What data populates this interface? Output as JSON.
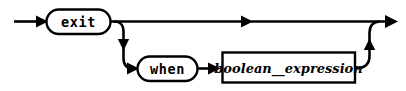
{
  "diagram": {
    "type": "railroad-syntax-diagram",
    "background_color": "#ffffff",
    "line_color": "#000000",
    "nodes": [
      {
        "id": "exit",
        "kind": "terminal",
        "shape": "rounded-rectangle",
        "label": "exit",
        "x": 46,
        "y": 9,
        "width": 64,
        "height": 25
      },
      {
        "id": "when",
        "kind": "terminal",
        "shape": "rounded-rectangle",
        "label": "when",
        "x": 137,
        "y": 56,
        "width": 60,
        "height": 25
      },
      {
        "id": "boolean_expression",
        "kind": "nonterminal",
        "shape": "rectangle",
        "label": "boolean__expression",
        "x": 222,
        "y": 52,
        "width": 133,
        "height": 30
      }
    ],
    "tracks": [
      {
        "id": "entry",
        "from": "start",
        "to": "exit",
        "label": "entry arrow into exit"
      },
      {
        "id": "main-bypass",
        "from": "exit",
        "to": "end",
        "label": "straight path skipping the when clause"
      },
      {
        "id": "branch-down",
        "from": "exit",
        "to": "when",
        "label": "optional when branch"
      },
      {
        "id": "when-to-expression",
        "from": "when",
        "to": "boolean_expression",
        "label": "when to boolean expression"
      },
      {
        "id": "merge-up",
        "from": "boolean_expression",
        "to": "end",
        "label": "merge back into main line"
      }
    ]
  }
}
